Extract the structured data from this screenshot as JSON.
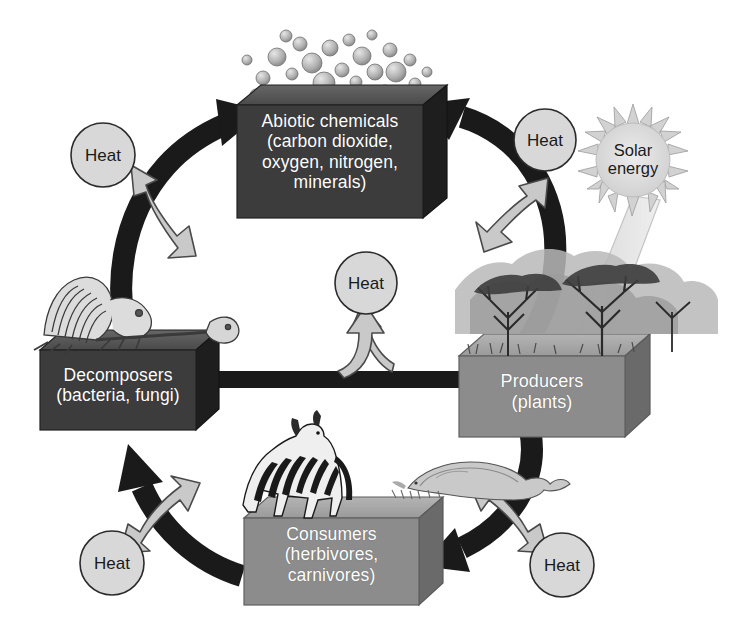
{
  "diagram": {
    "background_color": "#ffffff",
    "palette": {
      "dark_box": "#3c3c3c",
      "dark_box_top": "#5a5a5a",
      "dark_box_side": "#1e1e1e",
      "mid_box": "#8c8c8c",
      "mid_box_top": "#a8a8a8",
      "mid_box_side": "#6a6a6a",
      "black_arrow": "#1a1a1a",
      "heat_arrow_fill": "#c9c9c9",
      "heat_arrow_stroke": "#4a4a4a",
      "heat_circle_fill": "#d8d8d8",
      "heat_circle_stroke": "#2b2b2b",
      "sun_fill": "#dcdcdc",
      "sun_stroke": "#9a9a9a",
      "beam_fill": "#e8e8e8",
      "label_text": "#ffffff",
      "heat_text": "#1a1a1a"
    },
    "boxes": [
      {
        "id": "abiotic",
        "lines": [
          "Abiotic chemicals",
          "(carbon dioxide,",
          "oxygen, nitrogen,",
          "minerals)"
        ],
        "tone": "dark",
        "decoration": "molecule-bubbles"
      },
      {
        "id": "producers",
        "lines": [
          "Producers",
          "(plants)"
        ],
        "tone": "mid",
        "decoration": "acacia-trees"
      },
      {
        "id": "consumers",
        "lines": [
          "Consumers",
          "(herbivores,",
          "carnivores)"
        ],
        "tone": "mid",
        "decoration": "zebra-and-lion"
      },
      {
        "id": "decomposers",
        "lines": [
          "Decomposers",
          "(bacteria, fungi)"
        ],
        "tone": "dark",
        "decoration": "animal-skeleton"
      }
    ],
    "heat_nodes": [
      {
        "id": "heat-top-left",
        "label": "Heat"
      },
      {
        "id": "heat-top-right",
        "label": "Heat"
      },
      {
        "id": "heat-center",
        "label": "Heat"
      },
      {
        "id": "heat-bottom-left",
        "label": "Heat"
      },
      {
        "id": "heat-bottom-right",
        "label": "Heat"
      }
    ],
    "solar": {
      "line1": "Solar",
      "line2": "energy"
    },
    "flows": [
      {
        "from": "producers",
        "to": "abiotic",
        "style": "thick-black-arc"
      },
      {
        "from": "decomposers",
        "to": "abiotic",
        "style": "thick-black-arc"
      },
      {
        "from": "producers",
        "to": "consumers",
        "style": "thick-black-arc"
      },
      {
        "from": "consumers",
        "to": "decomposers",
        "style": "thick-black-arc"
      },
      {
        "from": "producers",
        "to": "decomposers",
        "style": "thick-black-straight"
      },
      {
        "from": "solar",
        "to": "producers",
        "style": "light-beam"
      }
    ]
  }
}
